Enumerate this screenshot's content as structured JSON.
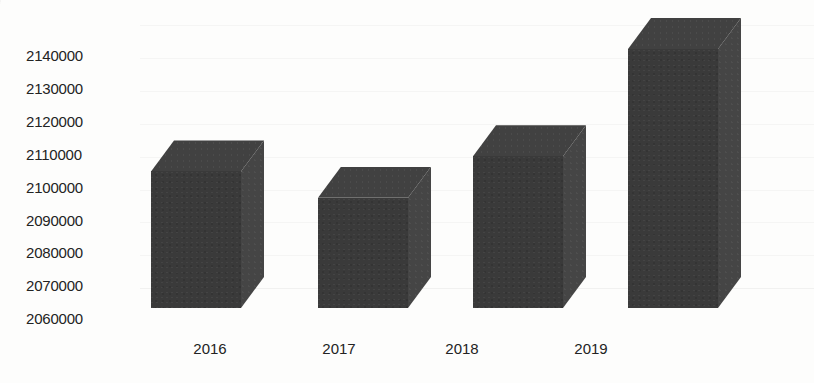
{
  "chart_data": {
    "type": "bar",
    "title": "",
    "subtitle": "",
    "xlabel": "",
    "ylabel": "",
    "categories": [
      "2016",
      "2017",
      "2018",
      "2019"
    ],
    "values": [
      2104900,
      2096900,
      2109500,
      2142100
    ],
    "series": [
      {
        "name": "",
        "values": [
          2104900,
          2096900,
          2109500,
          2142100
        ]
      }
    ],
    "ylim": [
      2060000,
      2145000
    ],
    "ytick_labels": [
      "2140000",
      "2130000",
      "2120000",
      "2110000",
      "2100000",
      "2090000",
      "2080000",
      "2070000",
      "2060000"
    ],
    "ytick_values": [
      2140000,
      2130000,
      2120000,
      2110000,
      2100000,
      2090000,
      2080000,
      2070000,
      2060000
    ],
    "grid": true,
    "legend": false,
    "legend_position": "none",
    "bar_style": "3d",
    "annotations": []
  },
  "style": {
    "bar_front_color": "#3a3a3a",
    "bar_side_color": "#454545",
    "bar_top_color": "#414141",
    "gridline_color": "#8a8a8a",
    "text_color": "#232323",
    "background_color": "#fdfdfc"
  }
}
